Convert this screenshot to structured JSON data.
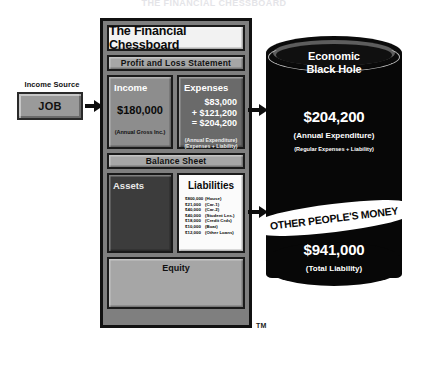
{
  "top_title": "THE FINANCIAL CHESSBOARD",
  "income_source": {
    "label": "Income Source",
    "box_label": "JOB"
  },
  "panel": {
    "title": "The Financial Chessboard",
    "trademark": "TM",
    "sections": {
      "profit_loss": "Profit and Loss Statement",
      "balance_sheet": "Balance Sheet",
      "equity": "Equity"
    },
    "income": {
      "title": "Income",
      "value": "$180,000",
      "note": "(Annual Gross Inc.)"
    },
    "expenses": {
      "title": "Expenses",
      "line1": "$83,000",
      "line2": "+ $121,200",
      "line3": "= $204,200",
      "note1": "(Annual Expenditure)",
      "note2": "(Expenses + Liability)"
    },
    "assets": {
      "title": "Assets"
    },
    "liabilities": {
      "title": "Liabilities",
      "items": [
        {
          "amount": "$800,000",
          "name": "(House)"
        },
        {
          "amount": "$21,000",
          "name": "(Car-1)"
        },
        {
          "amount": "$40,000",
          "name": "(Car-2)"
        },
        {
          "amount": "$40,000",
          "name": "(Student Lns.)"
        },
        {
          "amount": "$18,000",
          "name": "(Credit Crds)"
        },
        {
          "amount": "$10,000",
          "name": "(Boat)"
        },
        {
          "amount": "$12,000",
          "name": "(Other Loans)"
        }
      ]
    }
  },
  "black_hole": {
    "title_line1": "Economic",
    "title_line2": "Black Hole",
    "expenditure": {
      "value": "$204,200",
      "sub1": "(Annual Expenditure)",
      "sub2": "(Regular Expenses + Liability)"
    },
    "banner": "OTHER PEOPLE'S MONEY",
    "liability": {
      "value": "$941,000",
      "sub1": "(Total Liability)"
    }
  },
  "colors": {
    "panel_bg": "#7f7f7f",
    "black_hole": "#070707",
    "band": "#a6a6a6",
    "expenses_bg": "#6a6a6a",
    "assets_bg": "#3c3c3c",
    "liabilities_bg": "#fbfbfb"
  }
}
